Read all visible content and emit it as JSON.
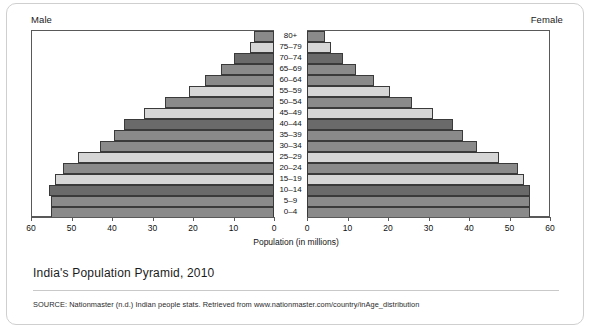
{
  "caption": "India's Population Pyramid, 2010",
  "source": "SOURCE: Nationmaster (n.d.) Indian people stats. Retrieved from www.nationmaster.com/country/inAge_distribution",
  "labels": {
    "male": "Male",
    "female": "Female"
  },
  "colors": {
    "shade_medium": "#8a8a8a",
    "shade_light": "#d6d6d6",
    "shade_dark": "#6a6a6a",
    "axis": "#595959",
    "text": "#121212",
    "card_border": "#cfcfcf"
  },
  "chart_data": {
    "type": "bar",
    "title": "India's Population Pyramid, 2010",
    "subtype": "population-pyramid",
    "xlabel": "Population (in millions)",
    "ylabel": "",
    "grid": false,
    "legend": "none",
    "orientation": "horizontal",
    "xlim_left": [
      60,
      0
    ],
    "xlim_right": [
      0,
      60
    ],
    "xticks_left": [
      60,
      50,
      40,
      30,
      20,
      10,
      0
    ],
    "xticks_right": [
      0,
      10,
      20,
      30,
      40,
      50,
      60
    ],
    "categories": [
      "80+",
      "75–79",
      "70–74",
      "65–69",
      "60–64",
      "55–59",
      "50–54",
      "45–49",
      "40–44",
      "35–39",
      "30–34",
      "25–29",
      "20–24",
      "15–19",
      "10–14",
      "5–9",
      "0–4"
    ],
    "series": [
      {
        "name": "Male",
        "side": "left",
        "values": [
          5.0,
          6.0,
          10.0,
          13.0,
          17.0,
          21.0,
          27.0,
          32.0,
          37.0,
          39.5,
          43.0,
          48.5,
          52.0,
          54.0,
          55.5,
          55.0,
          55.0
        ]
      },
      {
        "name": "Female",
        "side": "right",
        "values": [
          4.5,
          6.0,
          9.0,
          12.0,
          16.5,
          20.5,
          26.0,
          31.0,
          36.0,
          38.5,
          42.0,
          47.5,
          52.0,
          53.5,
          55.0,
          55.0,
          55.0
        ]
      }
    ],
    "bar_shades": [
      "#8a8a8a",
      "#d6d6d6",
      "#6a6a6a",
      "#8a8a8a",
      "#8a8a8a",
      "#d6d6d6",
      "#8a8a8a",
      "#d6d6d6",
      "#6a6a6a",
      "#8a8a8a",
      "#8a8a8a",
      "#d6d6d6",
      "#8a8a8a",
      "#d6d6d6",
      "#6a6a6a",
      "#8a8a8a",
      "#8a8a8a"
    ]
  }
}
